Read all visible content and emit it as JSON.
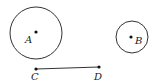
{
  "diagram": {
    "stroke_color": "#333333",
    "circles": [
      {
        "name": "A",
        "label": "A",
        "cx": 36,
        "cy": 33,
        "r": 26,
        "label_x": 25,
        "label_y": 43
      },
      {
        "name": "B",
        "label": "B",
        "cx": 132,
        "cy": 37,
        "r": 16,
        "label_x": 135,
        "label_y": 44
      }
    ],
    "points": [
      {
        "name": "C",
        "label": "C",
        "x": 36,
        "y": 69,
        "label_x": 31,
        "label_y": 80
      },
      {
        "name": "D",
        "label": "D",
        "x": 99,
        "y": 67,
        "label_x": 94,
        "label_y": 80
      }
    ],
    "segment": {
      "from": "C",
      "to": "D"
    }
  }
}
